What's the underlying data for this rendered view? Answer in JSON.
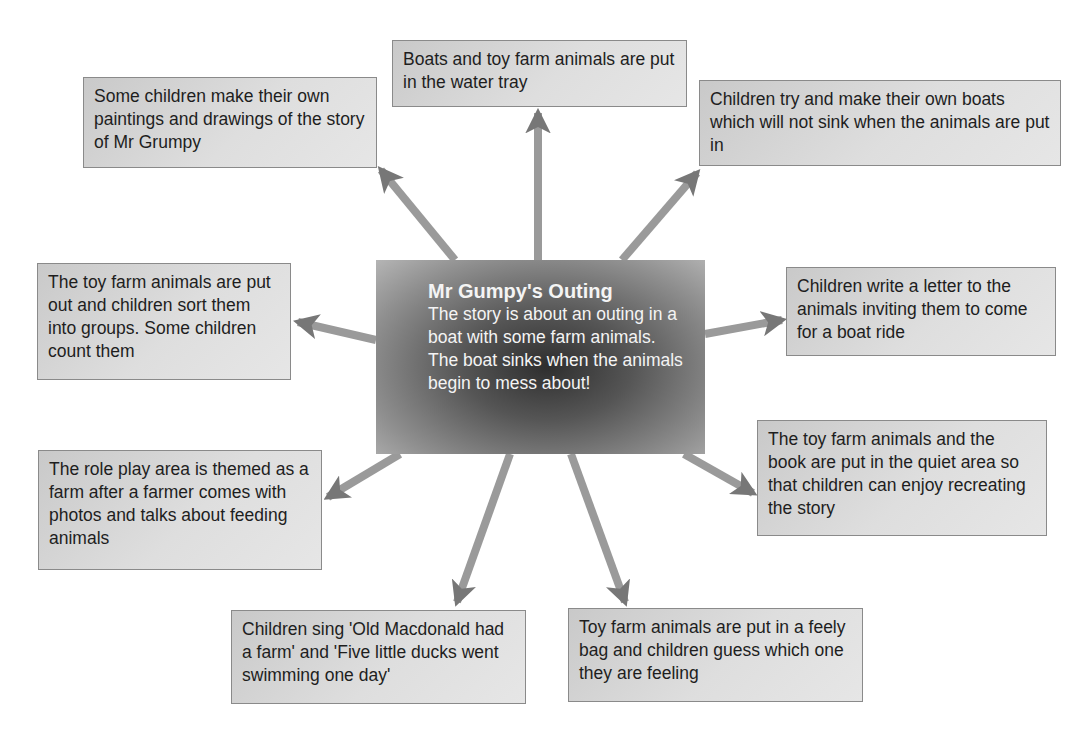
{
  "diagram": {
    "type": "mind-map",
    "center": {
      "title": "Mr Gumpy's Outing",
      "body": "The story is about an outing in a boat with some farm animals. The boat sinks when the animals begin to mess about!"
    },
    "activities": [
      {
        "id": "paintings",
        "text": "Some children make their own paintings and drawings of the story of Mr Grumpy"
      },
      {
        "id": "water-tray",
        "text": "Boats and toy farm animals are put in the water tray"
      },
      {
        "id": "make-boats",
        "text": "Children try and make their own boats which will not sink when the animals are put in"
      },
      {
        "id": "sort-count",
        "text": "The toy farm animals are put out and children sort them into groups. Some children count them"
      },
      {
        "id": "write-letter",
        "text": "Children write a letter to the animals inviting them to come for a boat ride"
      },
      {
        "id": "role-play",
        "text": "The role play area is themed as a farm after a farmer comes with photos and talks about feeding animals"
      },
      {
        "id": "quiet-area",
        "text": "The toy farm animals and the book are put in the quiet area so that children can enjoy recreating the story"
      },
      {
        "id": "sing-songs",
        "text": "Children sing 'Old Macdonald had a farm' and 'Five little ducks went swimming one day'"
      },
      {
        "id": "feely-bag",
        "text": "Toy farm animals are put in a feely bag and children guess which one they are feeling"
      }
    ],
    "colors": {
      "box_fill": "#d9d9d9",
      "box_border": "#8a8a8a",
      "arrow": "#7a7a7a",
      "center_dark": "#2e2e2e",
      "center_text": "#f4f4f4"
    }
  }
}
